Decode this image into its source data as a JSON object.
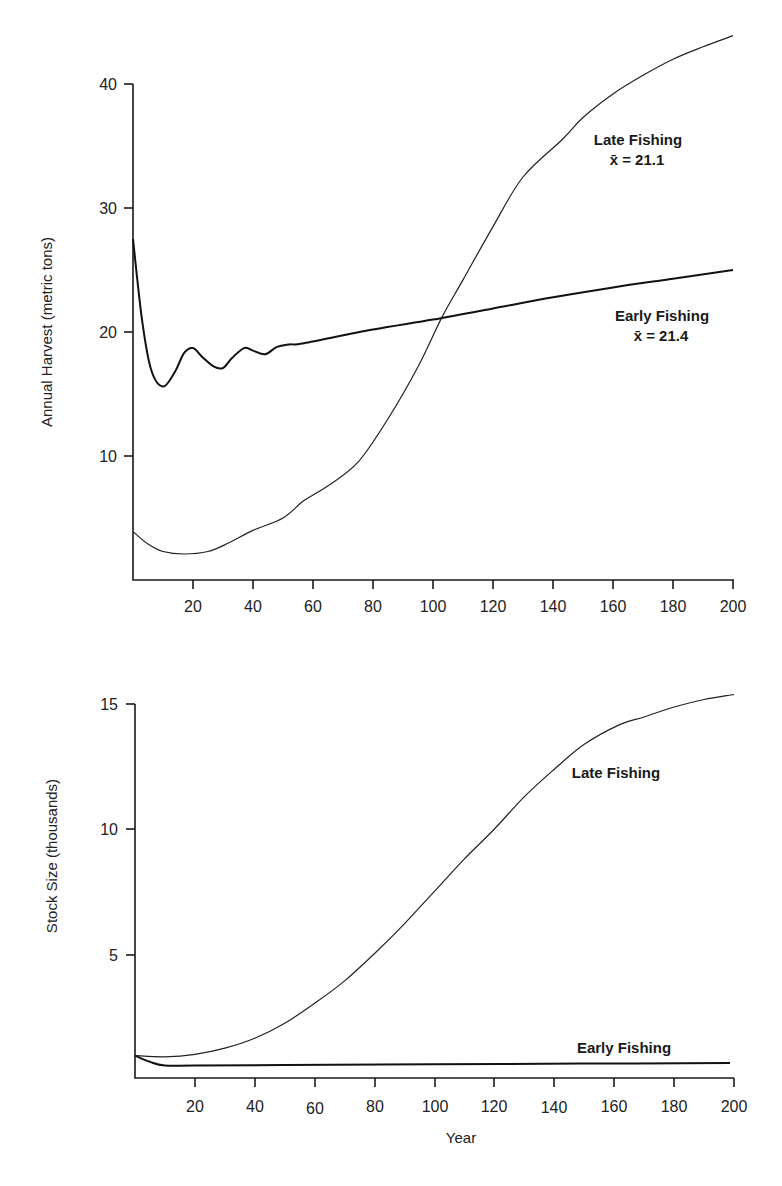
{
  "chart_data": [
    {
      "type": "line",
      "title": "",
      "xlabel": "",
      "ylabel": "Annual Harvest (metric tons)",
      "xlim": [
        0,
        200
      ],
      "ylim": [
        0,
        40
      ],
      "x_ticks": [
        20,
        40,
        60,
        80,
        100,
        120,
        140,
        160,
        180,
        200
      ],
      "y_ticks": [
        10,
        20,
        30,
        40
      ],
      "grid": false,
      "legend": "inline annotations",
      "series": [
        {
          "name": "Early Fishing",
          "annotation": "Early Fishing",
          "mean_label": "x̄ = 21.4",
          "x": [
            0,
            3,
            6,
            10,
            14,
            17,
            20,
            23,
            27,
            30,
            33,
            37,
            40,
            44,
            48,
            52,
            57,
            80,
            100,
            120,
            140,
            160,
            180,
            200
          ],
          "values": [
            27.5,
            21.0,
            17.0,
            15.6,
            16.8,
            18.3,
            18.7,
            18.0,
            17.2,
            17.1,
            17.9,
            18.7,
            18.5,
            18.2,
            18.8,
            19.0,
            19.1,
            20.2,
            21.0,
            21.9,
            22.8,
            23.6,
            24.3,
            25.0
          ]
        },
        {
          "name": "Late Fishing",
          "annotation": "Late Fishing",
          "mean_label": "x̄ = 21.1",
          "x": [
            0,
            5,
            10,
            17,
            25,
            32,
            40,
            50,
            57,
            65,
            75,
            85,
            95,
            103,
            110,
            120,
            130,
            143,
            150,
            160,
            170,
            180,
            190,
            200
          ],
          "values": [
            3.9,
            2.9,
            2.3,
            2.1,
            2.3,
            3.0,
            4.0,
            5.0,
            6.4,
            7.6,
            9.5,
            13.0,
            17.2,
            21.2,
            24.2,
            28.5,
            32.5,
            35.5,
            37.3,
            39.2,
            40.7,
            42.0,
            43.0,
            43.9
          ]
        }
      ]
    },
    {
      "type": "line",
      "title": "",
      "xlabel": "Year",
      "ylabel": "Stock Size (thousands)",
      "xlim": [
        0,
        200
      ],
      "ylim": [
        0,
        15
      ],
      "x_ticks": [
        20,
        40,
        60,
        80,
        100,
        120,
        140,
        160,
        180,
        200
      ],
      "y_ticks": [
        5,
        10,
        15
      ],
      "grid": false,
      "legend": "inline annotations",
      "series": [
        {
          "name": "Late Fishing",
          "annotation": "Late Fishing",
          "x": [
            0,
            10,
            20,
            30,
            40,
            50,
            60,
            70,
            80,
            90,
            100,
            110,
            120,
            130,
            140,
            150,
            162,
            170,
            180,
            190,
            200
          ],
          "values": [
            0.9,
            0.85,
            0.95,
            1.2,
            1.6,
            2.2,
            3.0,
            3.9,
            5.0,
            6.2,
            7.5,
            8.8,
            10.0,
            11.3,
            12.4,
            13.4,
            14.2,
            14.5,
            14.9,
            15.2,
            15.4
          ]
        },
        {
          "name": "Early Fishing",
          "annotation": "Early Fishing",
          "x": [
            0,
            5,
            10,
            20,
            50,
            100,
            150,
            200
          ],
          "values": [
            0.9,
            0.65,
            0.5,
            0.5,
            0.52,
            0.55,
            0.58,
            0.6
          ]
        }
      ]
    }
  ],
  "top_chart": {
    "ylabel": "Annual Harvest (metric tons)",
    "y_tick_labels": [
      "10",
      "20",
      "30",
      "40"
    ],
    "x_tick_labels": [
      "20",
      "40",
      "60",
      "80",
      "100",
      "120",
      "140",
      "160",
      "180",
      "200"
    ],
    "late_label": "Late Fishing",
    "late_mean": "x̄ = 21.1",
    "early_label": "Early Fishing",
    "early_mean": "x̄ = 21.4"
  },
  "bottom_chart": {
    "ylabel": "Stock Size (thousands)",
    "xlabel": "Year",
    "y_tick_labels": [
      "5",
      "10",
      "15"
    ],
    "x_tick_labels": [
      "20",
      "40",
      "60",
      "80",
      "100",
      "120",
      "140",
      "160",
      "180",
      "200"
    ],
    "late_label": "Late Fishing",
    "early_label": "Early Fishing"
  },
  "colors": {
    "line": "#111111",
    "background": "#ffffff"
  }
}
